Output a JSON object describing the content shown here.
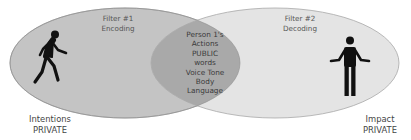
{
  "diagram": {
    "type": "venn",
    "colors": {
      "left_ellipse": "#c4c4c4",
      "right_ellipse": "#e4e4e4",
      "overlap": "#a9a9a9",
      "outline": "#9a9a9a",
      "icon": "#111111"
    },
    "left": {
      "filter_title": "Filter #1",
      "filter_subtitle": "Encoding",
      "icon": "person-walking-icon",
      "caption_line1": "Intentions",
      "caption_line2": "PRIVATE"
    },
    "right": {
      "filter_title": "Filter #2",
      "filter_subtitle": "Decoding",
      "icon": "person-shrugging-icon",
      "caption_line1": "Impact",
      "caption_line2": "PRIVATE"
    },
    "overlap": {
      "lines": [
        "Person 1's",
        "Actions",
        "PUBLIC",
        "words",
        "Voice Tone",
        "Body",
        "Language"
      ]
    }
  }
}
